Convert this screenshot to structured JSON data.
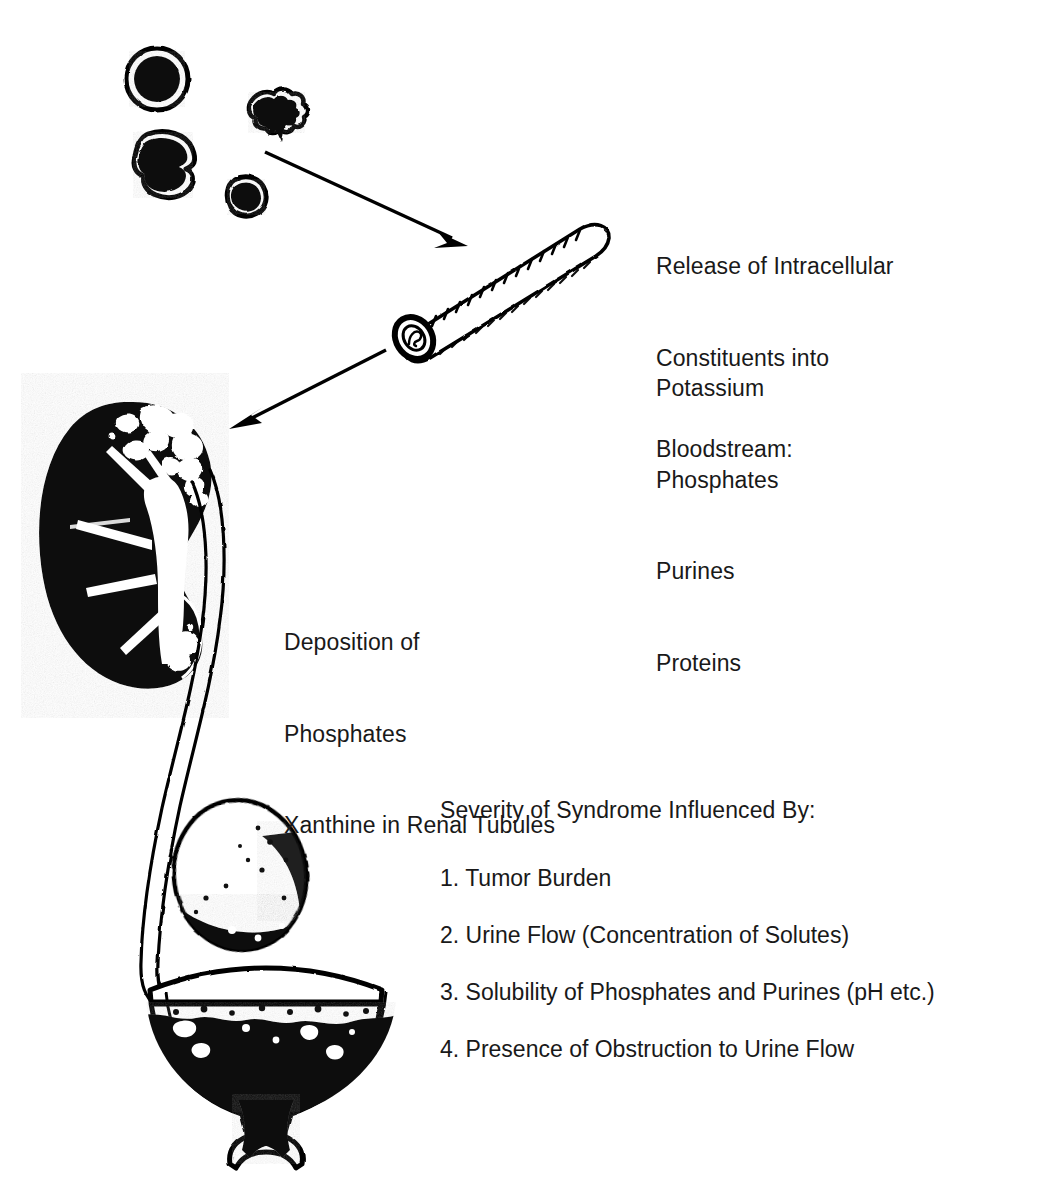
{
  "figure": {
    "kind": "medical-illustration",
    "background_color": "#ffffff",
    "ink_color": "#000000"
  },
  "illustration": {
    "tumor_cells": {
      "name": "lysing tumor cells",
      "count": 4,
      "description": "cluster of dark tumor cells, one intact and round, others ragged and fragmenting"
    },
    "blood_vessel": {
      "name": "blood vessel",
      "description": "diagonal cylindrical vessel with open lumen at the lower-left end and hatched shading along its upper surface"
    },
    "kidney": {
      "name": "kidney cross-section",
      "description": "solid dark bean-shaped kidney with white branching calyces and renal pelvis, white crystal deposits in the upper and lower poles"
    },
    "obstructing_mass": {
      "name": "obstructing mass",
      "description": "oval body lying against the ureter with stippled shading along its lower right"
    },
    "ureter": {
      "name": "ureter",
      "description": "long thin double-walled tube running from the renal pelvis down to the bladder"
    },
    "bladder": {
      "name": "urinary bladder",
      "description": "wide bladder with a straight horizontal fluid level and dense sediment below, narrowing into the urethra"
    },
    "arrows": [
      {
        "name": "cells-to-vessel-arrow",
        "from": "tumor cells",
        "to": "blood vessel"
      },
      {
        "name": "vessel-to-kidney-arrow",
        "from": "blood vessel",
        "to": "kidney"
      }
    ]
  },
  "release": {
    "heading_lines": [
      "Release of Intracellular",
      "Constituents into",
      "Bloodstream:"
    ],
    "constituents": [
      "Potassium",
      "Phosphates",
      "Purines",
      "Proteins"
    ]
  },
  "deposition": {
    "lines": [
      "Deposition of",
      "Phosphates",
      "Xanthine in Renal Tubules"
    ]
  },
  "severity": {
    "heading": "Severity of Syndrome Influenced By:",
    "items": [
      "1. Tumor Burden",
      "2. Urine Flow (Concentration of Solutes)",
      "3. Solubility of Phosphates and Purines (pH etc.)",
      "4. Presence of Obstruction to Urine Flow"
    ]
  }
}
